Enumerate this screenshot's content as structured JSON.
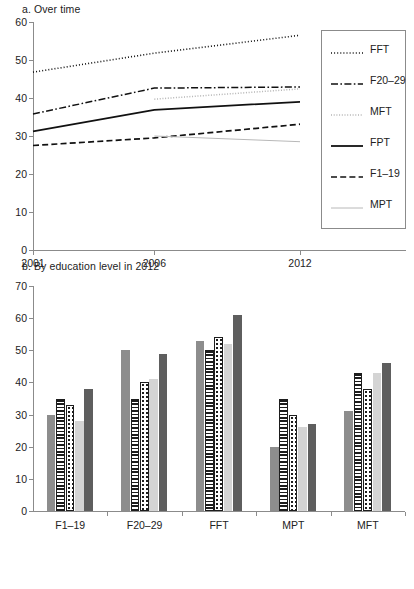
{
  "panel_a": {
    "title": "a. Over time",
    "y_ticks": [
      "60",
      "50",
      "40",
      "30",
      "20",
      "10",
      "0"
    ],
    "x_ticks": [
      "2001",
      "2006",
      "2012"
    ],
    "legend": [
      {
        "label": "FFT",
        "style": "dotted-bold"
      },
      {
        "label": "F20–29",
        "style": "dash-dot"
      },
      {
        "label": "MFT",
        "style": "dotted-light"
      },
      {
        "label": "FPT",
        "style": "solid-bold"
      },
      {
        "label": "F1–19",
        "style": "dashed"
      },
      {
        "label": "MPT",
        "style": "solid-light"
      }
    ]
  },
  "panel_b": {
    "title": "b. By education level in 2012",
    "y_ticks": [
      "70",
      "60",
      "50",
      "40",
      "30",
      "20",
      "10",
      "0"
    ],
    "legend": [
      "Level 0",
      "Level 1",
      "Level 2",
      "Level 3",
      "Level 4+"
    ]
  },
  "chart_data": [
    {
      "type": "line",
      "title": "a. Over time",
      "xlabel": "",
      "ylabel": "",
      "x": [
        2001,
        2006,
        2012
      ],
      "xtick_labels": [
        "2001",
        "2006",
        "2012"
      ],
      "ylim": [
        0,
        60
      ],
      "ytick_values": [
        0,
        10,
        20,
        30,
        40,
        50,
        60
      ],
      "grid": false,
      "legend_position": "right",
      "series": [
        {
          "name": "FFT",
          "style": "dotted",
          "x": [
            2001,
            2006,
            2012
          ],
          "values": [
            46.8,
            51.8,
            56.5
          ]
        },
        {
          "name": "F20–29",
          "style": "dash-dot",
          "x": [
            2001,
            2006,
            2012
          ],
          "values": [
            35.8,
            42.6,
            42.9
          ]
        },
        {
          "name": "MFT",
          "style": "dotted-light",
          "x": [
            2006,
            2012
          ],
          "values": [
            39.7,
            42.4
          ]
        },
        {
          "name": "FPT",
          "style": "solid",
          "x": [
            2001,
            2006,
            2012
          ],
          "values": [
            31.2,
            36.9,
            39.0
          ]
        },
        {
          "name": "F1–19",
          "style": "dashed",
          "x": [
            2001,
            2006,
            2012
          ],
          "values": [
            27.5,
            29.5,
            33.1
          ]
        },
        {
          "name": "MPT",
          "style": "solid-light",
          "x": [
            2006,
            2012
          ],
          "values": [
            30.0,
            28.5
          ]
        }
      ]
    },
    {
      "type": "bar",
      "title": "b. By education level in 2012",
      "xlabel": "",
      "ylabel": "",
      "categories": [
        "F1–19",
        "F20–29",
        "FFT",
        "MPT",
        "MFT"
      ],
      "ylim": [
        0,
        70
      ],
      "ytick_values": [
        0,
        10,
        20,
        30,
        40,
        50,
        60,
        70
      ],
      "grid": false,
      "legend_position": "bottom",
      "series": [
        {
          "name": "Level 0",
          "values": [
            30,
            50,
            53,
            20,
            31
          ]
        },
        {
          "name": "Level 1",
          "values": [
            35,
            35,
            50,
            35,
            43
          ]
        },
        {
          "name": "Level 2",
          "values": [
            33,
            40,
            54,
            30,
            38
          ]
        },
        {
          "name": "Level 3",
          "values": [
            28,
            41,
            52,
            26,
            43
          ]
        },
        {
          "name": "Level 4+",
          "values": [
            38,
            49,
            61,
            27,
            46
          ]
        }
      ]
    }
  ]
}
